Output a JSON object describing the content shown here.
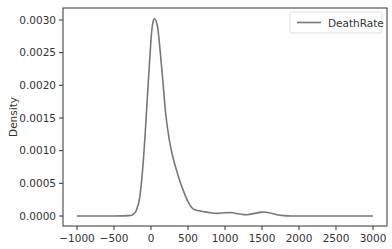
{
  "chart_data": {
    "type": "line",
    "subtype": "kde-density",
    "title": "",
    "xlabel": "",
    "ylabel": "Density",
    "xlim": [
      -1200,
      3100
    ],
    "ylim": [
      -0.00015,
      0.0032
    ],
    "xticks": [
      -1000,
      -500,
      0,
      500,
      1000,
      1500,
      2000,
      2500,
      3000
    ],
    "xtick_labels": [
      "−1000",
      "−500",
      "0",
      "500",
      "1000",
      "1500",
      "2000",
      "2500",
      "3000"
    ],
    "yticks": [
      0.0,
      0.0005,
      0.001,
      0.0015,
      0.002,
      0.0025,
      0.003
    ],
    "ytick_labels": [
      "0.0000",
      "0.0005",
      "0.0010",
      "0.0015",
      "0.0020",
      "0.0025",
      "0.0030"
    ],
    "grid": false,
    "legend_position": "upper right",
    "series": [
      {
        "name": "DeathRate",
        "color": "#777777",
        "x": [
          -1000,
          -500,
          -300,
          -250,
          -200,
          -150,
          -100,
          -50,
          0,
          25,
          50,
          75,
          100,
          150,
          200,
          250,
          300,
          350,
          400,
          450,
          500,
          550,
          600,
          700,
          800,
          900,
          1000,
          1100,
          1200,
          1300,
          1400,
          1500,
          1600,
          1700,
          1800,
          1900,
          2000,
          2500,
          3000
        ],
        "values": [
          0.0,
          0.0,
          5e-06,
          2e-05,
          8e-05,
          0.0003,
          0.0009,
          0.0018,
          0.0027,
          0.00296,
          0.00302,
          0.00296,
          0.0028,
          0.0022,
          0.00155,
          0.00115,
          0.00088,
          0.00068,
          0.0005,
          0.00035,
          0.00022,
          0.00013,
          9e-05,
          7e-05,
          5e-05,
          4e-05,
          5e-05,
          5e-05,
          3e-05,
          2e-05,
          4e-05,
          6e-05,
          5e-05,
          2e-05,
          5e-06,
          0.0,
          0.0,
          0.0,
          0.0
        ]
      }
    ]
  },
  "legend": {
    "entries": [
      {
        "label": "DeathRate",
        "color": "#777777"
      }
    ]
  }
}
